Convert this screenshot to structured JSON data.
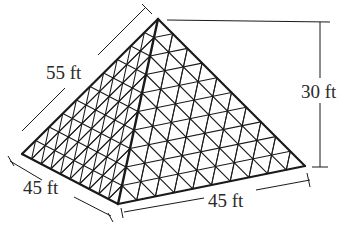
{
  "diagram": {
    "type": "square pyramid with triangular lattice faces",
    "labels": {
      "slant_edge": "55 ft",
      "height": "30 ft",
      "base_left": "45 ft",
      "base_right": "45 ft"
    },
    "geometry": {
      "apex": [
        158,
        19
      ],
      "base_left": [
        22,
        154
      ],
      "base_front": [
        118,
        204
      ],
      "base_right": [
        305,
        166
      ],
      "grid_divisions": 10
    },
    "colors": {
      "stroke": "#1a1a1a",
      "text": "#2a2a2a",
      "background": "#ffffff"
    }
  }
}
